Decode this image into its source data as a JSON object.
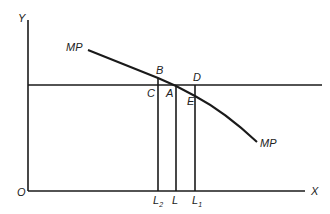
{
  "diagram": {
    "axes": {
      "y_label": "Y",
      "x_label": "X",
      "origin_label": "O"
    },
    "curve": {
      "label_left": "MP",
      "label_right": "MP"
    },
    "points": {
      "B": "B",
      "C": "C",
      "A": "A",
      "D": "D",
      "E": "E"
    },
    "x_ticks": [
      {
        "main": "L",
        "sub": "2"
      },
      {
        "main": "L",
        "sub": ""
      },
      {
        "main": "L",
        "sub": "1"
      }
    ]
  }
}
